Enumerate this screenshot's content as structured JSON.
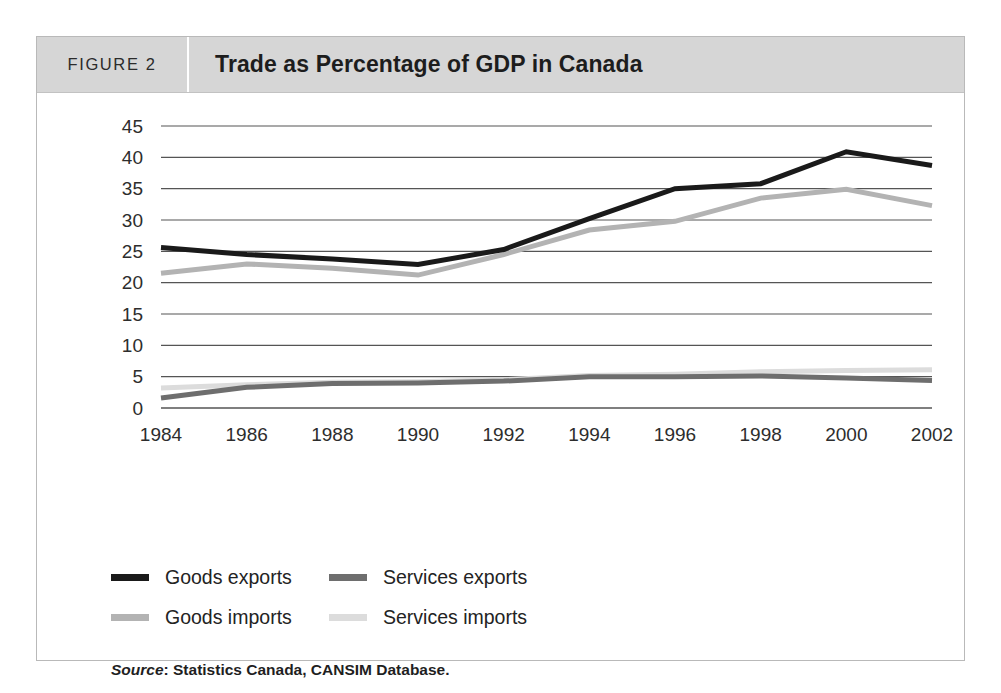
{
  "figure": {
    "number_label": "FIGURE 2",
    "title": "Trade as Percentage of GDP in Canada",
    "source_prefix": "Source",
    "source_text": ": Statistics Canada, CANSIM Database."
  },
  "legend": {
    "items": [
      {
        "label": "Goods exports",
        "color": "#1a1a1a"
      },
      {
        "label": "Services exports",
        "color": "#6e6e6e"
      },
      {
        "label": "Goods imports",
        "color": "#b3b3b3"
      },
      {
        "label": "Services imports",
        "color": "#dcdcdc"
      }
    ]
  },
  "chart_data": {
    "type": "line",
    "title": "Trade as Percentage of GDP in Canada",
    "xlabel": "",
    "ylabel": "",
    "categories": [
      1984,
      1986,
      1988,
      1990,
      1992,
      1994,
      1996,
      1998,
      2000,
      2002
    ],
    "x_tick_labels": [
      "1984",
      "1986",
      "1988",
      "1990",
      "1992",
      "1994",
      "1996",
      "1998",
      "2000",
      "2002"
    ],
    "y_tick_labels": [
      "45",
      "40",
      "35",
      "30",
      "25",
      "20",
      "15",
      "10",
      "5",
      "0"
    ],
    "y_ticks": [
      0,
      5,
      10,
      15,
      20,
      25,
      30,
      35,
      40,
      45
    ],
    "ylim": [
      0,
      45
    ],
    "grid": "horizontal",
    "legend_position": "below-plot",
    "series": [
      {
        "name": "Goods exports",
        "color": "#1a1a1a",
        "width": 5,
        "values": [
          25.6,
          24.5,
          23.8,
          22.9,
          25.3,
          30.2,
          35.0,
          35.8,
          40.9,
          38.7
        ]
      },
      {
        "name": "Goods imports",
        "color": "#b3b3b3",
        "width": 5,
        "values": [
          21.5,
          23.0,
          22.3,
          21.2,
          24.5,
          28.4,
          29.8,
          33.5,
          34.9,
          32.3
        ]
      },
      {
        "name": "Services exports",
        "color": "#6e6e6e",
        "width": 5,
        "values": [
          1.6,
          3.3,
          3.9,
          4.0,
          4.3,
          5.0,
          5.0,
          5.1,
          4.8,
          4.4
        ]
      },
      {
        "name": "Services imports",
        "color": "#dcdcdc",
        "width": 5,
        "values": [
          3.2,
          3.7,
          4.1,
          4.2,
          4.5,
          5.2,
          5.4,
          5.8,
          6.0,
          6.1
        ]
      }
    ]
  },
  "colors": {
    "header_band": "#d6d6d6",
    "frame_border": "#b9b9b9",
    "gridline": "#555555",
    "page_background": "#ffffff"
  }
}
